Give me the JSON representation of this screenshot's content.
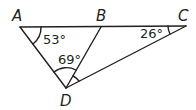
{
  "diagram": {
    "type": "geometry-triangle",
    "stroke_color": "#231f20",
    "background": "#ffffff",
    "points": {
      "A": {
        "label": "A",
        "x": 20,
        "y": 27
      },
      "B": {
        "label": "B",
        "x": 101,
        "y": 27
      },
      "C": {
        "label": "C",
        "x": 186,
        "y": 26
      },
      "D": {
        "label": "D",
        "x": 66,
        "y": 88
      }
    },
    "segments": [
      "AC",
      "AD",
      "BD",
      "CD"
    ],
    "angles": [
      {
        "vertex": "A",
        "label": "53°"
      },
      {
        "vertex": "D",
        "between": "AD-BD",
        "label": "69°"
      },
      {
        "vertex": "C",
        "label": "26°"
      },
      {
        "vertex": "D",
        "between": "BD-CD",
        "label": ""
      }
    ]
  }
}
